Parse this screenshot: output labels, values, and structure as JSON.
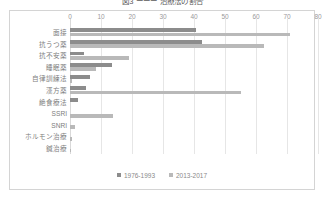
{
  "chart_data": {
    "type": "bar",
    "orientation": "horizontal",
    "title": "図3 ーーー 治療法の割合",
    "xlabel": "",
    "ylabel": "",
    "xlim": [
      0,
      80
    ],
    "xticks": [
      0,
      10,
      20,
      30,
      40,
      50,
      60,
      70,
      80
    ],
    "grid": true,
    "legend_position": "bottom",
    "categories": [
      "面接",
      "抗うつ薬",
      "抗不安薬",
      "睡眠薬",
      "自律訓練法",
      "漢方薬",
      "絶食療法",
      "SSRI",
      "SNRI",
      "ホルモン治療",
      "鍼治療"
    ],
    "series": [
      {
        "name": "1976-1993",
        "color": "#8c8c8c",
        "values": [
          40.5,
          42.5,
          4.5,
          13.5,
          6.5,
          5.0,
          2.5,
          0,
          0,
          0,
          0
        ]
      },
      {
        "name": "2013-2017",
        "color": "#b9b9b9",
        "values": [
          71.0,
          62.5,
          19.0,
          8.5,
          0.8,
          55.0,
          0,
          14.0,
          1.5,
          0.7,
          0.4
        ]
      }
    ]
  },
  "axis": {
    "ticks": [
      "0",
      "10",
      "20",
      "30",
      "40",
      "50",
      "60",
      "70",
      "80"
    ]
  },
  "legend": {
    "items": [
      {
        "label": "1976-1993"
      },
      {
        "label": "2013-2017"
      }
    ]
  }
}
